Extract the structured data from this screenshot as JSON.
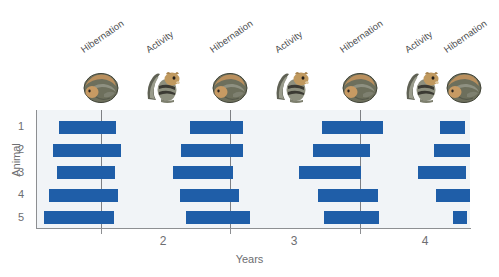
{
  "chart_data": {
    "type": "bar",
    "title": "",
    "subtitle": "",
    "xlabel": "Years",
    "ylabel": "Animal",
    "orientation": "horizontal",
    "bar_color": "#1f5ea8",
    "plot_background": "#f1f4f7",
    "grid": {
      "vertical": true,
      "horizontal": false,
      "vertical_positions_years": [
        1.5,
        2.5,
        3.5
      ]
    },
    "xlim": [
      1.0,
      4.35
    ],
    "xticks": [
      1.5,
      2.5,
      3.5
    ],
    "xtick_labels": [
      "2",
      "3",
      "4"
    ],
    "xtick_label_positions_years": [
      2.0,
      3.0,
      4.0
    ],
    "ylim_categories": [
      "1",
      "2",
      "3",
      "4",
      "5"
    ],
    "ytick_labels": [
      "1",
      "2",
      "3",
      "4",
      "5"
    ],
    "legend": {
      "show": false,
      "position": "none"
    },
    "annotations": [
      {
        "text": "Hibernation",
        "x_years": 1.5,
        "rotation": -35
      },
      {
        "text": "Activity",
        "x_years": 2.0,
        "rotation": -35
      },
      {
        "text": "Hibernation",
        "x_years": 2.5,
        "rotation": -35
      },
      {
        "text": "Activity",
        "x_years": 3.0,
        "rotation": -35
      },
      {
        "text": "Hibernation",
        "x_years": 3.5,
        "rotation": -35
      },
      {
        "text": "Activity",
        "x_years": 4.0,
        "rotation": -35
      },
      {
        "text": "Hibernation",
        "x_years": 4.3,
        "rotation": -35
      }
    ],
    "series": [
      {
        "name": "Animal 1",
        "row": 1,
        "intervals": [
          {
            "start_years": 1.18,
            "end_years": 1.62
          },
          {
            "start_years": 2.19,
            "end_years": 2.6
          },
          {
            "start_years": 3.21,
            "end_years": 3.68
          },
          {
            "start_years": 4.12,
            "end_years": 4.31
          }
        ]
      },
      {
        "name": "Animal 2",
        "row": 2,
        "intervals": [
          {
            "start_years": 1.13,
            "end_years": 1.66
          },
          {
            "start_years": 2.12,
            "end_years": 2.6
          },
          {
            "start_years": 3.14,
            "end_years": 3.58
          },
          {
            "start_years": 4.07,
            "end_years": 4.35
          }
        ]
      },
      {
        "name": "Animal 3",
        "row": 3,
        "intervals": [
          {
            "start_years": 1.16,
            "end_years": 1.61
          },
          {
            "start_years": 2.06,
            "end_years": 2.52
          },
          {
            "start_years": 3.03,
            "end_years": 3.51
          },
          {
            "start_years": 3.95,
            "end_years": 4.32
          }
        ]
      },
      {
        "name": "Animal 4",
        "row": 4,
        "intervals": [
          {
            "start_years": 1.1,
            "end_years": 1.63
          },
          {
            "start_years": 2.11,
            "end_years": 2.57
          },
          {
            "start_years": 3.18,
            "end_years": 3.64
          },
          {
            "start_years": 4.09,
            "end_years": 4.35
          }
        ]
      },
      {
        "name": "Animal 5",
        "row": 5,
        "intervals": [
          {
            "start_years": 1.06,
            "end_years": 1.6
          },
          {
            "start_years": 2.16,
            "end_years": 2.65
          },
          {
            "start_years": 3.22,
            "end_years": 3.65
          },
          {
            "start_years": 4.22,
            "end_years": 4.33
          }
        ]
      }
    ]
  },
  "icons": [
    {
      "name": "hibernating-squirrel-icon",
      "phase": "Hibernation",
      "x_years": 1.5
    },
    {
      "name": "active-squirrel-icon",
      "phase": "Activity",
      "x_years": 2.0
    },
    {
      "name": "hibernating-squirrel-icon",
      "phase": "Hibernation",
      "x_years": 2.5
    },
    {
      "name": "active-squirrel-icon",
      "phase": "Activity",
      "x_years": 3.0
    },
    {
      "name": "hibernating-squirrel-icon",
      "phase": "Hibernation",
      "x_years": 3.5
    },
    {
      "name": "active-squirrel-icon",
      "phase": "Activity",
      "x_years": 4.0
    },
    {
      "name": "hibernating-squirrel-icon",
      "phase": "Hibernation",
      "x_years": 4.3
    }
  ]
}
